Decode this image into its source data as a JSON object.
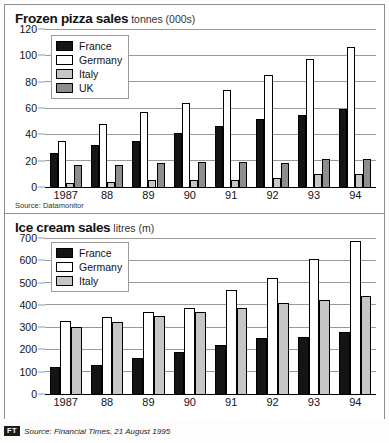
{
  "footer": {
    "logo": "FT",
    "text": "Source: Financial Times, 21 August 1995"
  },
  "panels": [
    {
      "id": "pizza",
      "title": "Frozen pizza sales",
      "unit": "tonnes (000s)",
      "source_note": "Source: Datamonitor",
      "legend": [
        {
          "label": "France",
          "key": "france",
          "color": "#141414"
        },
        {
          "label": "Germany",
          "key": "germany",
          "color": "#ffffff"
        },
        {
          "label": "Italy",
          "key": "italy",
          "color": "#c6c6c6"
        },
        {
          "label": "UK",
          "key": "uk",
          "color": "#8e8e8e"
        }
      ]
    },
    {
      "id": "ice",
      "title": "Ice cream sales",
      "unit": "litres (m)",
      "legend": [
        {
          "label": "France",
          "key": "france",
          "color": "#141414"
        },
        {
          "label": "Germany",
          "key": "germany",
          "color": "#ffffff"
        },
        {
          "label": "Italy",
          "key": "italy",
          "color": "#c6c6c6"
        }
      ]
    }
  ],
  "chart_data": [
    {
      "type": "bar",
      "id": "pizza",
      "title": "Frozen pizza sales",
      "subtitle": "tonnes (000s)",
      "xlabel": "",
      "ylabel": "tonnes (000s)",
      "categories": [
        "1987",
        "88",
        "89",
        "90",
        "91",
        "92",
        "93",
        "94"
      ],
      "ylim": [
        0,
        120
      ],
      "yticks": [
        0,
        20,
        40,
        60,
        80,
        100,
        120
      ],
      "grid": true,
      "legend_position": "top-left",
      "series": [
        {
          "name": "France",
          "color": "#141414",
          "values": [
            26,
            32,
            35,
            41,
            46,
            52,
            55,
            59
          ]
        },
        {
          "name": "Germany",
          "color": "#ffffff",
          "values": [
            35,
            48,
            57,
            64,
            74,
            85,
            97,
            106
          ]
        },
        {
          "name": "Italy",
          "color": "#c6c6c6",
          "values": [
            3,
            4,
            5,
            5,
            5,
            7,
            10,
            10
          ]
        },
        {
          "name": "UK",
          "color": "#8e8e8e",
          "values": [
            17,
            17,
            18,
            19,
            19,
            18,
            21,
            21
          ]
        }
      ],
      "source": "Source: Datamonitor"
    },
    {
      "type": "bar",
      "id": "ice",
      "title": "Ice cream sales",
      "subtitle": "litres (m)",
      "xlabel": "",
      "ylabel": "litres (m)",
      "categories": [
        "1987",
        "88",
        "89",
        "90",
        "91",
        "92",
        "93",
        "94"
      ],
      "ylim": [
        0,
        700
      ],
      "yticks": [
        0,
        100,
        200,
        300,
        400,
        500,
        600,
        700
      ],
      "grid": true,
      "legend_position": "top-left",
      "series": [
        {
          "name": "France",
          "color": "#141414",
          "values": [
            122,
            132,
            160,
            188,
            222,
            250,
            256,
            278
          ]
        },
        {
          "name": "Germany",
          "color": "#ffffff",
          "values": [
            328,
            345,
            368,
            388,
            465,
            520,
            605,
            685
          ]
        },
        {
          "name": "Italy",
          "color": "#c6c6c6",
          "values": [
            300,
            322,
            352,
            368,
            385,
            410,
            422,
            438
          ]
        }
      ]
    }
  ]
}
